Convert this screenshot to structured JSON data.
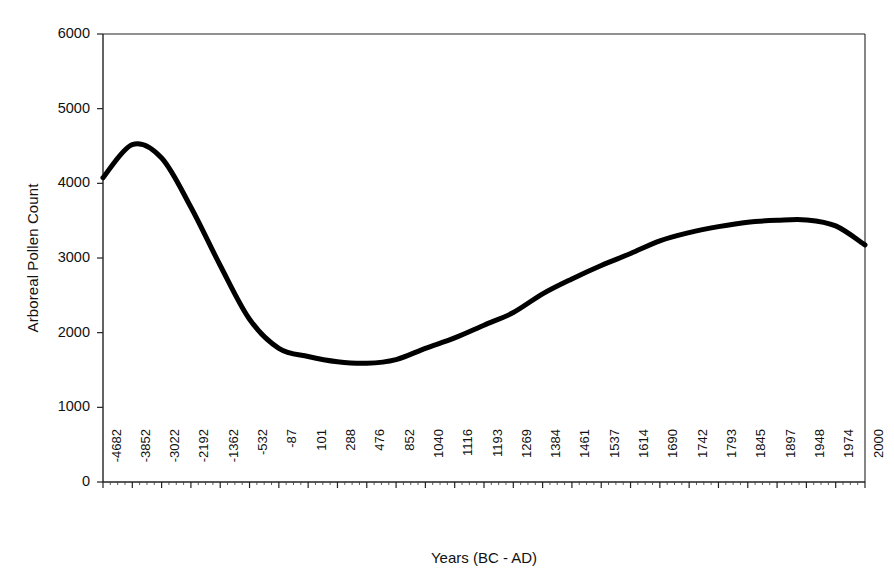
{
  "chart_data": {
    "type": "line",
    "title": "",
    "xlabel": "Years (BC - AD)",
    "ylabel": "Arboreal Pollen Count",
    "ylim": [
      0,
      6000
    ],
    "y_ticks": [
      0,
      1000,
      2000,
      3000,
      4000,
      5000,
      6000
    ],
    "y_tick_labels": [
      "0",
      "1000",
      "2000",
      "3000",
      "4000",
      "5000",
      "6000"
    ],
    "grid": false,
    "legend": "none",
    "line_color": "#000000",
    "line_width": 5,
    "categories": [
      "-4682",
      "-3852",
      "-3022",
      "-2192",
      "-1362",
      "-532",
      "-87",
      "101",
      "288",
      "476",
      "852",
      "1040",
      "1116",
      "1193",
      "1269",
      "1384",
      "1461",
      "1537",
      "1614",
      "1690",
      "1742",
      "1793",
      "1845",
      "1897",
      "1948",
      "1974",
      "2000"
    ],
    "series": [
      {
        "name": "Arboreal Pollen Count",
        "values": [
          4075,
          4520,
          4340,
          3680,
          2900,
          2180,
          1790,
          1680,
          1610,
          1590,
          1640,
          1790,
          1930,
          2100,
          2270,
          2520,
          2720,
          2900,
          3060,
          3230,
          3340,
          3420,
          3480,
          3505,
          3510,
          3430,
          3175
        ]
      }
    ],
    "annotations": {
      "peak_value": 4520,
      "peak_category": "-3852",
      "trough_value": 1590,
      "trough_category": "476",
      "secondary_peak_value": 3510,
      "secondary_peak_category": "1948",
      "end_value": 3175
    }
  },
  "axis": {
    "x_tick_labels": [
      "-4682",
      "-3852",
      "-3022",
      "-2192",
      "-1362",
      "-532",
      "-87",
      "101",
      "288",
      "476",
      "852",
      "1040",
      "1116",
      "1193",
      "1269",
      "1384",
      "1461",
      "1537",
      "1614",
      "1690",
      "1742",
      "1793",
      "1845",
      "1897",
      "1948",
      "1974",
      "2000"
    ]
  }
}
